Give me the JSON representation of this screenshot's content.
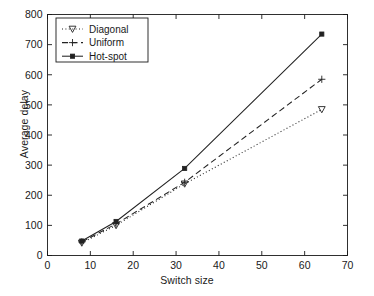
{
  "chart_data": {
    "type": "line",
    "title": "",
    "subtitle": "",
    "xlabel": "Switch size",
    "ylabel": "Average delay",
    "xlim": [
      0,
      70
    ],
    "ylim": [
      0,
      800
    ],
    "xticks": [
      0,
      10,
      20,
      30,
      40,
      50,
      60,
      70
    ],
    "yticks": [
      0,
      100,
      200,
      300,
      400,
      500,
      600,
      700,
      800
    ],
    "grid": false,
    "legend_position": "top-left",
    "x": [
      8,
      16,
      32,
      64
    ],
    "series": [
      {
        "name": "Diagonal",
        "values": [
          42,
          100,
          238,
          485
        ],
        "linestyle": "dotted",
        "marker": "triangle-down",
        "color": "#222222"
      },
      {
        "name": "Uniform",
        "values": [
          45,
          105,
          243,
          585
        ],
        "linestyle": "dashed",
        "marker": "plus",
        "color": "#222222"
      },
      {
        "name": "Hot-spot",
        "values": [
          48,
          113,
          289,
          735
        ],
        "linestyle": "solid",
        "marker": "filled-square",
        "color": "#222222"
      }
    ]
  },
  "legend": {
    "entries": [
      {
        "label": "Diagonal"
      },
      {
        "label": "Uniform"
      },
      {
        "label": "Hot-spot"
      }
    ]
  },
  "axes": {
    "x_label": "Switch size",
    "y_label": "Average delay",
    "x_tick_labels": [
      "0",
      "10",
      "20",
      "30",
      "40",
      "50",
      "60",
      "70"
    ],
    "y_tick_labels": [
      "0",
      "100",
      "200",
      "300",
      "400",
      "500",
      "600",
      "700",
      "800"
    ]
  },
  "caption": {
    "text": ""
  },
  "colors": {
    "axis": "#1a1a1a",
    "line": "#222222",
    "background": "#ffffff"
  }
}
